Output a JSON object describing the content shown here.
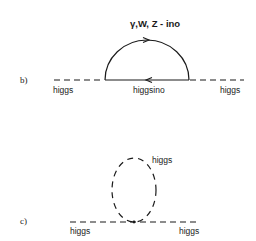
{
  "diagram_b": {
    "panel_label": "b)",
    "loop_label": "γ,W, Z - ino",
    "left_external_label": "higgs",
    "internal_label": "higgsino",
    "right_external_label": "higgs",
    "left_line_style": "dashed",
    "right_line_style": "dashed",
    "arc_line_style": "solid",
    "arc_arrow_direction": "right",
    "internal_line_style": "solid",
    "internal_arrow_direction": "left"
  },
  "diagram_c": {
    "panel_label": "c)",
    "loop_label": "higgs",
    "left_external_label": "higgs",
    "right_external_label": "higgs",
    "external_line_style": "dashed",
    "loop_line_style": "dashed"
  },
  "colors": {
    "ink": "#1a1a1a",
    "background": "#ffffff"
  }
}
